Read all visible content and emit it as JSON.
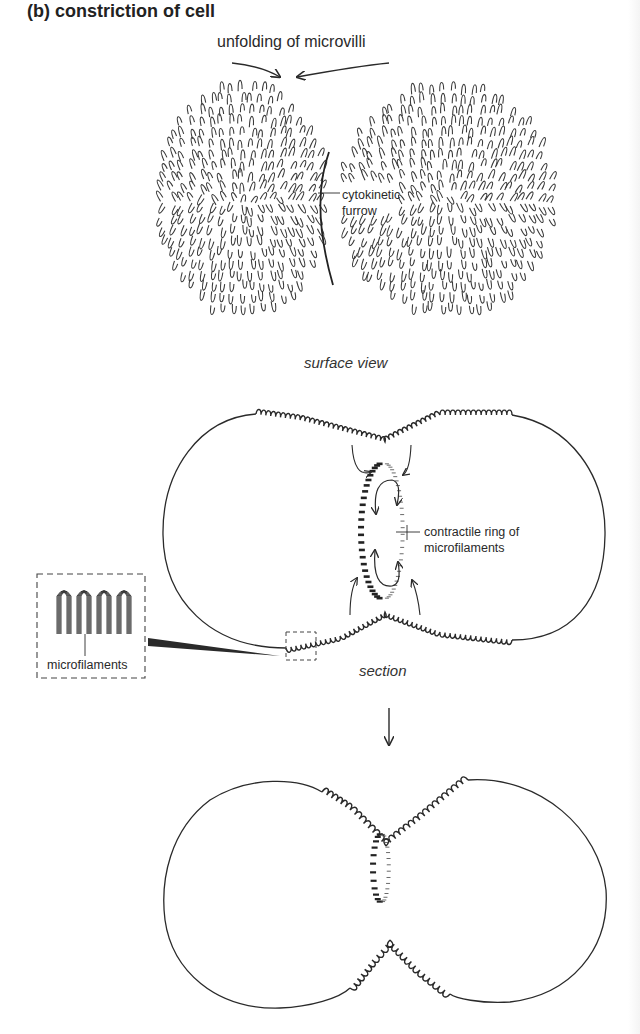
{
  "figure": {
    "heading": "(b) constriction of cell",
    "panels": [
      {
        "id": "surface-view",
        "caption": "surface view",
        "top_label": "unfolding of microvilli",
        "annotations": [
          {
            "line1": "cytokinetic",
            "line2": "furrow"
          }
        ]
      },
      {
        "id": "section",
        "caption": "section",
        "annotations": [
          {
            "line1": "contractile ring of",
            "line2": "microfilaments"
          },
          {
            "line1": "microfilaments"
          }
        ]
      },
      {
        "id": "later-stage",
        "caption": ""
      }
    ],
    "colors": {
      "ink": "#2a2a2a",
      "background": "#ffffff"
    }
  }
}
